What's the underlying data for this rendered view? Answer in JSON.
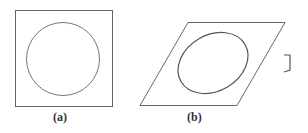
{
  "figures": [
    {
      "id": "a",
      "label": "(a)",
      "shape": "square",
      "inner": "circle"
    },
    {
      "id": "b",
      "label": "(b)",
      "shape": "parallelogram",
      "inner": "ellipse"
    }
  ],
  "colors": {
    "stroke": "#555555",
    "background": "#ffffff"
  }
}
